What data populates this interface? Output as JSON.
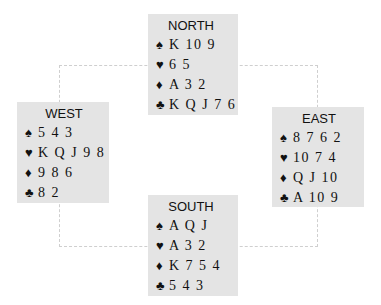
{
  "diagram": {
    "hands": [
      {
        "seat": "NORTH",
        "suits": [
          {
            "icon": "♠",
            "name": "spades",
            "cards": "K 10 9"
          },
          {
            "icon": "♥",
            "name": "hearts",
            "cards": "6 5"
          },
          {
            "icon": "♦",
            "name": "diamonds",
            "cards": "A 3 2"
          },
          {
            "icon": "♣",
            "name": "clubs",
            "cards": "K Q J 7 6"
          }
        ]
      },
      {
        "seat": "WEST",
        "suits": [
          {
            "icon": "♠",
            "name": "spades",
            "cards": "5 4 3"
          },
          {
            "icon": "♥",
            "name": "hearts",
            "cards": "K Q J 9 8"
          },
          {
            "icon": "♦",
            "name": "diamonds",
            "cards": "9 8 6"
          },
          {
            "icon": "♣",
            "name": "clubs",
            "cards": "8 2"
          }
        ]
      },
      {
        "seat": "EAST",
        "suits": [
          {
            "icon": "♠",
            "name": "spades",
            "cards": "8 7 6 2"
          },
          {
            "icon": "♥",
            "name": "hearts",
            "cards": "10 7 4"
          },
          {
            "icon": "♦",
            "name": "diamonds",
            "cards": "Q J 10"
          },
          {
            "icon": "♣",
            "name": "clubs",
            "cards": "A 10 9"
          }
        ]
      },
      {
        "seat": "SOUTH",
        "suits": [
          {
            "icon": "♠",
            "name": "spades",
            "cards": "A Q J"
          },
          {
            "icon": "♥",
            "name": "hearts",
            "cards": "A 3 2"
          },
          {
            "icon": "♦",
            "name": "diamonds",
            "cards": "K 7 5 4"
          },
          {
            "icon": "♣",
            "name": "clubs",
            "cards": "5 4 3"
          }
        ]
      }
    ],
    "colors": {
      "box_background": "#e4e4e4",
      "text": "#111111",
      "connector": "#cfcfcf"
    }
  }
}
